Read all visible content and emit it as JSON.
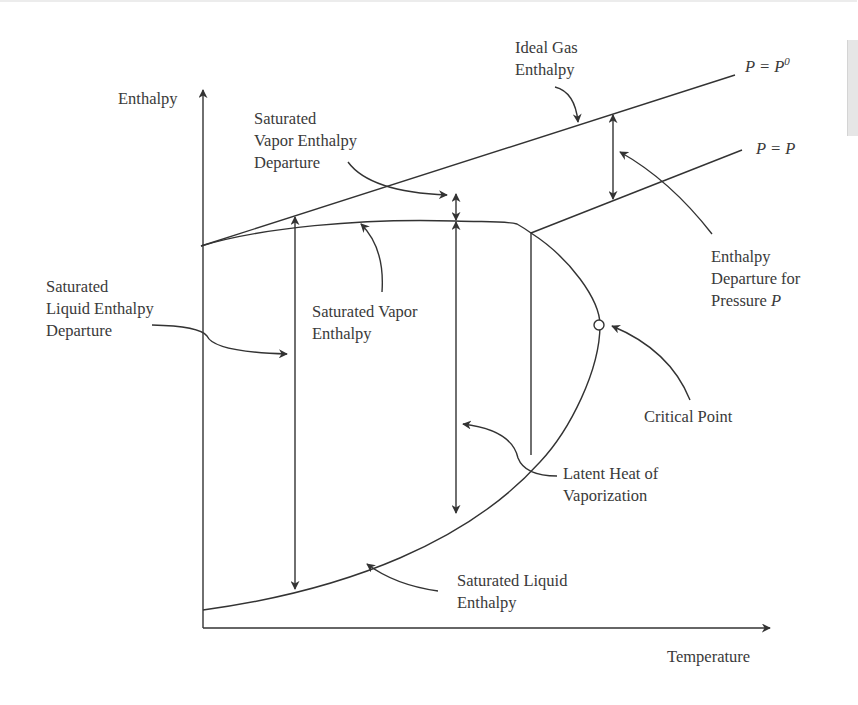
{
  "diagram": {
    "axes": {
      "y_label": "Enthalpy",
      "x_label": "Temperature"
    },
    "curves": {
      "ideal_gas": {
        "label": "P = P⁰",
        "label_main": "P = P",
        "label_sup": "0"
      },
      "pressure_p": {
        "label": "P = P"
      }
    },
    "annotations": {
      "ideal_gas_enthalpy": [
        "Ideal Gas",
        "Enthalpy"
      ],
      "sat_vapor_departure": [
        "Saturated",
        "Vapor Enthalpy",
        "Departure"
      ],
      "enthalpy_departure_p": [
        "Enthalpy",
        "Departure for",
        "Pressure "
      ],
      "enthalpy_departure_p_italic": "P",
      "sat_liquid_departure": [
        "Saturated",
        "Liquid Enthalpy",
        "Departure"
      ],
      "sat_vapor_enthalpy": [
        "Saturated Vapor",
        "Enthalpy"
      ],
      "critical_point": "Critical Point",
      "latent_heat": [
        "Latent Heat of",
        "Vaporization"
      ],
      "sat_liquid_enthalpy": [
        "Saturated Liquid",
        "Enthalpy"
      ]
    },
    "colors": {
      "line": "#333333",
      "text": "#3a3a3a",
      "background": "#ffffff"
    }
  }
}
